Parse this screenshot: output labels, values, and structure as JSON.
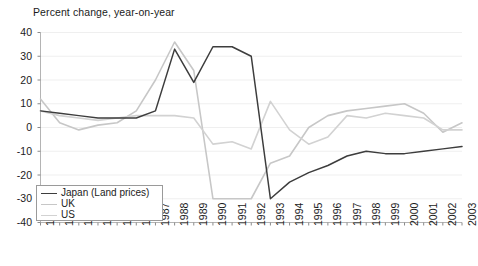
{
  "chart_data": {
    "type": "line",
    "title": "Percent change, year-on-year",
    "xlabel": "",
    "ylabel": "",
    "ylim": [
      -40,
      40
    ],
    "ytick_step": 10,
    "yticks": [
      "40",
      "30",
      "20",
      "10",
      "0",
      "-10",
      "-20",
      "-30",
      "-40"
    ],
    "grid": true,
    "grid_axis": "y",
    "legend_position": "bottom-left",
    "x": [
      1981,
      1982,
      1983,
      1984,
      1985,
      1986,
      1987,
      1988,
      1989,
      1990,
      1991,
      1992,
      1993,
      1994,
      1995,
      1996,
      1997,
      1998,
      1999,
      2000,
      2001,
      2002,
      2003
    ],
    "categories": [
      "1981",
      "1982",
      "1983",
      "1984",
      "1985",
      "1986",
      "1987",
      "1988",
      "1989",
      "1990",
      "1991",
      "1992",
      "1993",
      "1994",
      "1995",
      "1996",
      "1997",
      "1998",
      "1999",
      "2000",
      "2001",
      "2002",
      "2003"
    ],
    "series": [
      {
        "name": "Japan (Land prices)",
        "color": "#3d3d3d",
        "values": [
          7,
          6,
          5,
          4,
          4,
          4,
          7,
          33,
          19,
          34,
          34,
          30,
          -30,
          -23,
          -19,
          -16,
          -12,
          -10,
          -11,
          -11,
          -10,
          -9,
          -8
        ]
      },
      {
        "name": "UK",
        "color": "#c7c7c7",
        "values": [
          12,
          2,
          -1,
          1,
          2,
          7,
          20,
          36,
          24,
          -30,
          -30,
          -30,
          -15,
          -12,
          0,
          5,
          7,
          8,
          9,
          10,
          6,
          -2,
          2
        ]
      },
      {
        "name": "US",
        "color": "#d2d2d2",
        "values": [
          7,
          5,
          4,
          3,
          4,
          5,
          5,
          5,
          4,
          -7,
          -6,
          -9,
          11,
          -1,
          -7,
          -4,
          5,
          4,
          6,
          5,
          4,
          -1,
          -1
        ]
      }
    ]
  },
  "legend": {
    "items": [
      {
        "label": "Japan (Land prices)",
        "color": "#3d3d3d"
      },
      {
        "label": "UK",
        "color": "#c7c7c7"
      },
      {
        "label": "US",
        "color": "#d2d2d2"
      }
    ]
  },
  "axes": {
    "y": {
      "min": -40,
      "max": 40,
      "step": 10
    },
    "x": {
      "min": 1981,
      "max": 2003
    }
  }
}
